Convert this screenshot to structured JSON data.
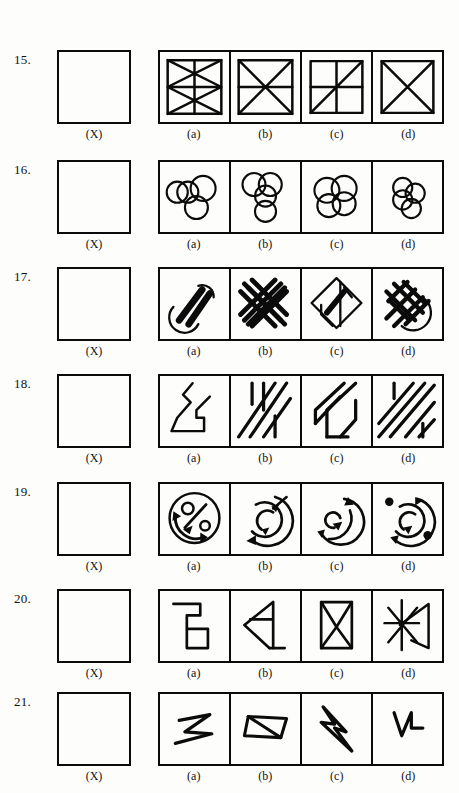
{
  "page": {
    "type": "non-verbal-reasoning-worksheet",
    "background_color": "#fdfdfb",
    "ink_color": "#0b0b0b",
    "question_count": 7,
    "option_labels": [
      "(a)",
      "(b)",
      "(c)",
      "(d)"
    ],
    "problem_label": "(X)"
  },
  "rows": [
    {
      "number": "15.",
      "problem_caption": "(X)",
      "problem_figure": "square-with-arrowhead-chevron",
      "options": [
        {
          "label": "(a)",
          "figure": "square-with-nested-diagonals-and-bars"
        },
        {
          "label": "(b)",
          "figure": "square-with-bowtie-and-horizontal-midline"
        },
        {
          "label": "(c)",
          "figure": "square-quartered-with-one-diagonal"
        },
        {
          "label": "(d)",
          "figure": "square-with-full-x-diagonals"
        }
      ]
    },
    {
      "number": "16.",
      "problem_caption": "(X)",
      "problem_figure": "two-stacked-arcs-branching",
      "options": [
        {
          "label": "(a)",
          "figure": "four-overlapping-circles-row-plus-one-below"
        },
        {
          "label": "(b)",
          "figure": "three-circles-cluster-plus-one-below"
        },
        {
          "label": "(c)",
          "figure": "four-overlapping-circles-diamond"
        },
        {
          "label": "(d)",
          "figure": "four-overlapping-circles-compact-cluster"
        }
      ]
    },
    {
      "number": "17.",
      "problem_caption": "(X)",
      "problem_figure": "single-thick-diagonal-rounded-bar",
      "options": [
        {
          "label": "(a)",
          "figure": "two-rounded-bars-with-loop"
        },
        {
          "label": "(b)",
          "figure": "woven-cross-lattice-of-rounded-bars"
        },
        {
          "label": "(c)",
          "figure": "diamond-with-folded-bars"
        },
        {
          "label": "(d)",
          "figure": "dense-woven-lattice-with-arc"
        }
      ]
    },
    {
      "number": "18.",
      "problem_caption": "(X)",
      "problem_figure": "rectangle-with-diagonal-stripes-and-verticals",
      "options": [
        {
          "label": "(a)",
          "figure": "zigzag-staircase-outline"
        },
        {
          "label": "(b)",
          "figure": "diagonal-stripes-with-verticals-left"
        },
        {
          "label": "(c)",
          "figure": "diagonal-band-with-hooks"
        },
        {
          "label": "(d)",
          "figure": "dense-diagonal-stripes"
        }
      ]
    },
    {
      "number": "19.",
      "problem_caption": "(X)",
      "problem_figure": "circular-arrow-clockwise-broken-ring",
      "options": [
        {
          "label": "(a)",
          "figure": "circle-with-percent-sign-and-arrows"
        },
        {
          "label": "(b)",
          "figure": "concentric-arrow-rings-with-diagonal-arrow"
        },
        {
          "label": "(c)",
          "figure": "concentric-arrow-arcs-with-arrowheads"
        },
        {
          "label": "(d)",
          "figure": "concentric-arrow-rings-with-two-dots"
        }
      ]
    },
    {
      "number": "20.",
      "problem_caption": "(X)",
      "problem_figure": "vertical-line-with-two-horizontal-stubs",
      "options": [
        {
          "label": "(a)",
          "figure": "stepped-line-with-square"
        },
        {
          "label": "(b)",
          "figure": "triangle-with-horizontal-tail"
        },
        {
          "label": "(c)",
          "figure": "hourglass-bowtie-in-frame"
        },
        {
          "label": "(d)",
          "figure": "asterisk-star-with-arrow"
        }
      ]
    },
    {
      "number": "21.",
      "problem_caption": "(X)",
      "problem_figure": "rectangle-with-crossing-diagonals-web",
      "options": [
        {
          "label": "(a)",
          "figure": "thin-zigzag-arrow-stroke"
        },
        {
          "label": "(b)",
          "figure": "flat-parallelogram-with-diagonal"
        },
        {
          "label": "(c)",
          "figure": "lightning-bolt-zigzag"
        },
        {
          "label": "(d)",
          "figure": "check-mark-with-square-step"
        }
      ]
    }
  ]
}
